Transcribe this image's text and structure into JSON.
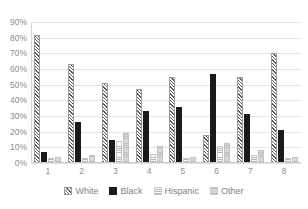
{
  "chart_data": {
    "type": "bar",
    "title": "",
    "subtitle": "",
    "xlabel": "",
    "ylabel": "",
    "categories": [
      "1",
      "2",
      "3",
      "4",
      "5",
      "6",
      "7",
      "8"
    ],
    "series": [
      {
        "name": "White",
        "pattern": "diagonal-hatch",
        "color": "#5d5d5d",
        "values": [
          82,
          63,
          51,
          47,
          55,
          18,
          55,
          70
        ]
      },
      {
        "name": "Black",
        "pattern": "solid",
        "color": "#1a1a1a",
        "values": [
          7,
          26,
          15,
          33,
          36,
          57,
          31,
          21
        ]
      },
      {
        "name": "Hispanic",
        "pattern": "horizontal-lines",
        "color": "#b6b6b6",
        "values": [
          3,
          3,
          14,
          6,
          3,
          11,
          5,
          3
        ]
      },
      {
        "name": "Other",
        "pattern": "light-gray",
        "color": "#cfcfcf",
        "values": [
          4,
          5,
          19,
          11,
          4,
          13,
          8,
          4
        ]
      }
    ],
    "ylim": [
      0,
      90
    ],
    "ytick_labels": [
      "0%",
      "10%",
      "20%",
      "30%",
      "40%",
      "50%",
      "60%",
      "70%",
      "80%",
      "90%"
    ],
    "ytick_values": [
      0,
      10,
      20,
      30,
      40,
      50,
      60,
      70,
      80,
      90
    ],
    "grid": true,
    "grid_axis": "y",
    "legend_position": "bottom",
    "legend_entries": [
      "White",
      "Black",
      "Hispanic",
      "Other"
    ]
  },
  "axis": {
    "grid_color": "#e3e3e3",
    "tick_label_color": "#8d8d8d"
  }
}
